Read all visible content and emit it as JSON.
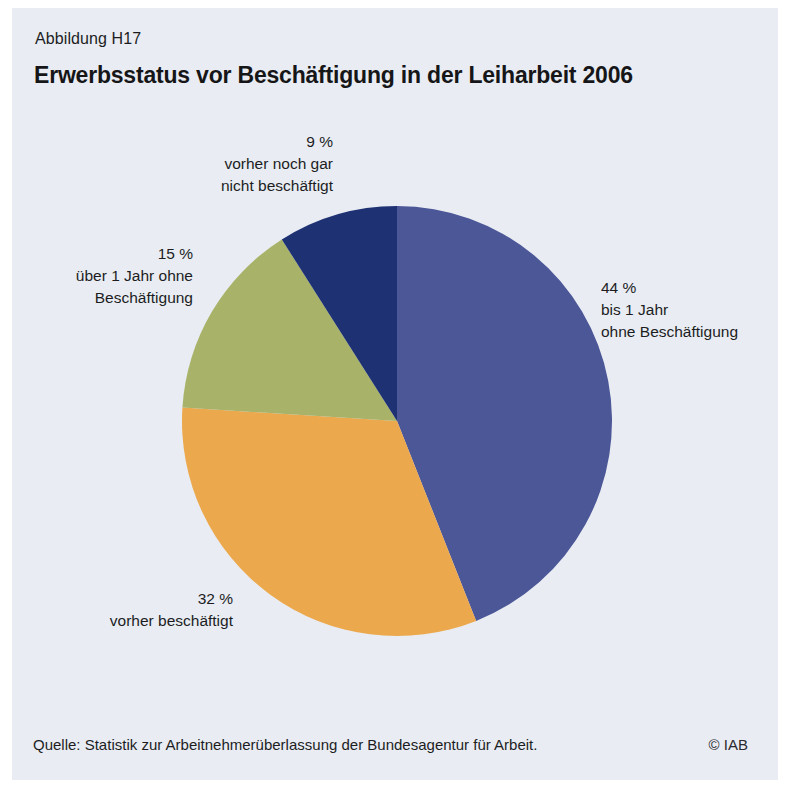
{
  "figure": {
    "label": "Abbildung H17",
    "title": "Erwerbsstatus vor Beschäftigung in der Leiharbeit 2006",
    "source": "Quelle: Statistik zur Arbeitnehmerüberlassung der Bundesagentur für Arbeit.",
    "copyright": "© IAB"
  },
  "colors": {
    "panel_background": "#e9edf3",
    "page_background": "#ffffff",
    "text": "#1d1d1f"
  },
  "chart_data": {
    "type": "pie",
    "title": "Erwerbsstatus vor Beschäftigung in der Leiharbeit 2006",
    "unit": "%",
    "start_angle_deg": 0,
    "direction": "clockwise",
    "legend": "none",
    "slices": [
      {
        "label": "bis 1 Jahr ohne Beschäftigung",
        "value": 44,
        "display": "44 %",
        "color": "#4c5798",
        "label_lines": [
          "44 %",
          "bis 1 Jahr",
          "ohne Beschäftigung"
        ]
      },
      {
        "label": "vorher beschäftigt",
        "value": 32,
        "display": "32 %",
        "color": "#eca84c",
        "label_lines": [
          "32 %",
          "vorher beschäftigt"
        ]
      },
      {
        "label": "über 1 Jahr ohne Beschäftigung",
        "value": 15,
        "display": "15 %",
        "color": "#a8b369",
        "label_lines": [
          "15 %",
          "über 1 Jahr ohne",
          "Beschäftigung"
        ]
      },
      {
        "label": "vorher noch gar nicht beschäftigt",
        "value": 9,
        "display": "9 %",
        "color": "#1e3173",
        "label_lines": [
          "9 %",
          "vorher noch gar",
          "nicht beschäftigt"
        ]
      }
    ]
  }
}
